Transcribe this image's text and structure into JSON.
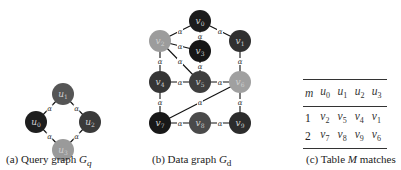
{
  "query_graph": {
    "caption_prefix": "(a) Query graph ",
    "caption_symbol": "G",
    "caption_sub": "q",
    "nodes": [
      {
        "id": "u1",
        "label": "u",
        "sub": "1",
        "x": 63,
        "y": 94,
        "color": "#555555"
      },
      {
        "id": "u0",
        "label": "u",
        "sub": "0",
        "x": 36,
        "y": 122,
        "color": "#1e1e1e"
      },
      {
        "id": "u2",
        "label": "u",
        "sub": "2",
        "x": 90,
        "y": 122,
        "color": "#3a3a3a"
      },
      {
        "id": "u3",
        "label": "u",
        "sub": "3",
        "x": 63,
        "y": 150,
        "color": "#9a9a9a"
      }
    ],
    "edges": [
      [
        "u1",
        "u0"
      ],
      [
        "u1",
        "u2"
      ],
      [
        "u0",
        "u3"
      ],
      [
        "u2",
        "u3"
      ]
    ],
    "edge_label": "α"
  },
  "data_graph": {
    "caption_prefix": "(b) Data graph ",
    "caption_symbol": "G",
    "caption_sub": "d",
    "nodes": [
      {
        "id": "v0",
        "label": "v",
        "sub": "0",
        "x": 200,
        "y": 21,
        "color": "#1c1c1c"
      },
      {
        "id": "v2",
        "label": "v",
        "sub": "2",
        "x": 160,
        "y": 41,
        "color": "#9c9c9c"
      },
      {
        "id": "v3",
        "label": "v",
        "sub": "3",
        "x": 200,
        "y": 51,
        "color": "#161616"
      },
      {
        "id": "v1",
        "label": "v",
        "sub": "1",
        "x": 240,
        "y": 41,
        "color": "#303030"
      },
      {
        "id": "v4",
        "label": "v",
        "sub": "4",
        "x": 160,
        "y": 82,
        "color": "#353535"
      },
      {
        "id": "v5",
        "label": "v",
        "sub": "5",
        "x": 200,
        "y": 82,
        "color": "#3e3e3e"
      },
      {
        "id": "v6",
        "label": "v",
        "sub": "6",
        "x": 240,
        "y": 82,
        "color": "#a0a0a0"
      },
      {
        "id": "v7",
        "label": "v",
        "sub": "7",
        "x": 160,
        "y": 123,
        "color": "#181818"
      },
      {
        "id": "v8",
        "label": "v",
        "sub": "8",
        "x": 200,
        "y": 123,
        "color": "#4a4a4a"
      },
      {
        "id": "v9",
        "label": "v",
        "sub": "9",
        "x": 240,
        "y": 123,
        "color": "#2c2c2c"
      }
    ],
    "edges": [
      [
        "v2",
        "v0"
      ],
      [
        "v0",
        "v3"
      ],
      [
        "v0",
        "v1"
      ],
      [
        "v2",
        "v3"
      ],
      [
        "v2",
        "v4"
      ],
      [
        "v2",
        "v5"
      ],
      [
        "v2",
        "v5b"
      ],
      [
        "v3",
        "v5"
      ],
      [
        "v1",
        "v6"
      ],
      [
        "v4",
        "v5"
      ],
      [
        "v5",
        "v6"
      ],
      [
        "v4",
        "v7"
      ],
      [
        "v6",
        "v9"
      ],
      [
        "v6",
        "v7"
      ],
      [
        "v7",
        "v8"
      ],
      [
        "v8",
        "v9"
      ]
    ],
    "edge_label": "α"
  },
  "table": {
    "caption_prefix": "(c) Table ",
    "caption_symbol": "M",
    "caption_suffix": " matches",
    "headers": [
      "m",
      "u0",
      "u1",
      "u2",
      "u3"
    ],
    "rows": [
      [
        "1",
        "v2",
        "v5",
        "v4",
        "v1"
      ],
      [
        "2",
        "v7",
        "v8",
        "v9",
        "v6"
      ]
    ]
  }
}
